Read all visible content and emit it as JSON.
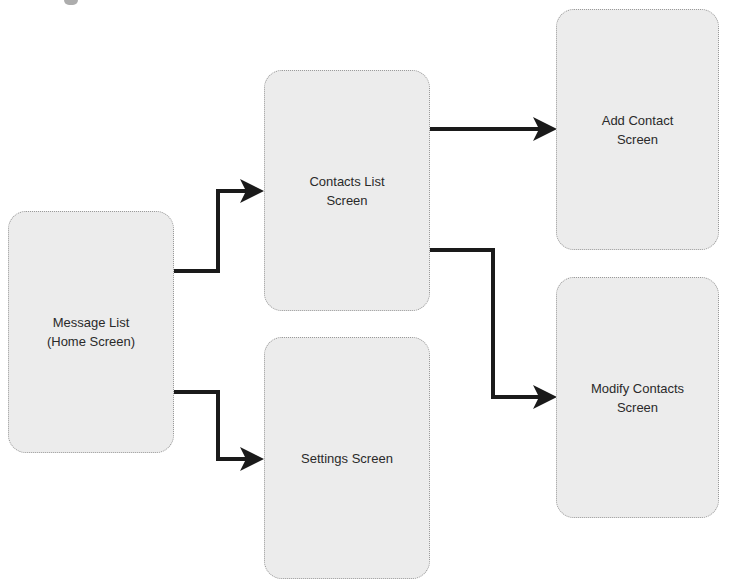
{
  "diagram": {
    "type": "screen-flow",
    "nodes": [
      {
        "id": "message-list",
        "label": "Message List\n(Home Screen)"
      },
      {
        "id": "contacts-list",
        "label": "Contacts List\nScreen"
      },
      {
        "id": "settings",
        "label": "Settings Screen"
      },
      {
        "id": "add-contact",
        "label": "Add Contact\nScreen"
      },
      {
        "id": "modify-contacts",
        "label": "Modify Contacts\nScreen"
      }
    ],
    "edges": [
      {
        "from": "message-list",
        "to": "contacts-list"
      },
      {
        "from": "message-list",
        "to": "settings"
      },
      {
        "from": "contacts-list",
        "to": "add-contact"
      },
      {
        "from": "contacts-list",
        "to": "modify-contacts"
      }
    ],
    "colors": {
      "node_fill": "#ececec",
      "node_border": "#9a9a9a",
      "arrow": "#1a1a1a",
      "text": "#2a2a2a"
    }
  }
}
